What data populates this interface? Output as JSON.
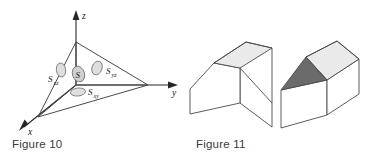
{
  "figures": [
    {
      "id": "figure-10",
      "caption": "Figure 10",
      "kind": "3d-axes-tetrahedron",
      "axes": [
        {
          "name": "x-axis",
          "label": "x"
        },
        {
          "name": "y-axis",
          "label": "y"
        },
        {
          "name": "z-axis",
          "label": "z"
        }
      ],
      "patches": [
        {
          "name": "patch-S",
          "symbol": "S",
          "subscript": ""
        },
        {
          "name": "patch-Sxz",
          "symbol": "S",
          "subscript": "xz"
        },
        {
          "name": "patch-Syz",
          "symbol": "S",
          "subscript": "yz"
        },
        {
          "name": "patch-Sxy",
          "symbol": "S",
          "subscript": "xy"
        }
      ],
      "colors": {
        "stroke": "#4a4a4a",
        "axis": "#262626",
        "patch_fill": "#d8d8d8",
        "patch_stroke": "#6e6e6e"
      }
    },
    {
      "id": "figure-11",
      "caption": "Figure 11",
      "kind": "two-prism-solids",
      "solids": [
        {
          "name": "gable-roof-prism",
          "faces": [
            {
              "name": "front-gable-face",
              "shade": "white"
            },
            {
              "name": "side-wall-face",
              "shade": "white"
            },
            {
              "name": "roof-slope-face",
              "shade": "light-gray"
            }
          ]
        },
        {
          "name": "hip-roof-prism",
          "faces": [
            {
              "name": "front-wall-face",
              "shade": "white"
            },
            {
              "name": "side-wall-face",
              "shade": "white"
            },
            {
              "name": "hip-end-triangle",
              "shade": "dark-gray"
            },
            {
              "name": "roof-slope-face",
              "shade": "light-gray"
            }
          ]
        }
      ],
      "colors": {
        "stroke": "#4a4a4a",
        "face_white": "#ffffff",
        "face_light": "#eaeaea",
        "face_dark": "#6b6b6b"
      }
    }
  ]
}
